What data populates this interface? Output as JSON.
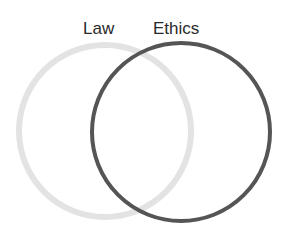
{
  "diagram": {
    "type": "venn",
    "sets": [
      {
        "label": "Law",
        "color": "#e3e3e3",
        "circle": {
          "cx": 105,
          "cy": 131,
          "r": 86,
          "stroke_width": 6
        }
      },
      {
        "label": "Ethics",
        "color": "#555555",
        "circle": {
          "cx": 181,
          "cy": 132,
          "r": 89,
          "stroke_width": 4
        }
      }
    ]
  }
}
